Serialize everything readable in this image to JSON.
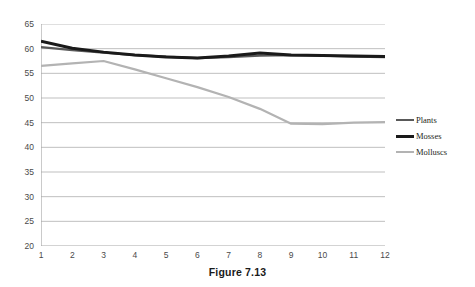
{
  "caption": "Figure 7.13",
  "legend": {
    "position": "right",
    "items": [
      {
        "label": "Plants",
        "color": "#595959",
        "width": 2.2,
        "name": "legend-item-plants"
      },
      {
        "label": "Mosses",
        "color": "#1a1a1a",
        "width": 3.0,
        "name": "legend-item-mosses"
      },
      {
        "label": "Molluscs",
        "color": "#b3b3b3",
        "width": 2.2,
        "name": "legend-item-molluscs"
      }
    ]
  },
  "chart_data": {
    "type": "line",
    "title": "",
    "xlabel": "",
    "ylabel": "",
    "grid": true,
    "x": [
      1,
      2,
      3,
      4,
      5,
      6,
      7,
      8,
      9,
      10,
      11,
      12
    ],
    "categories": [
      "1",
      "2",
      "3",
      "4",
      "5",
      "6",
      "7",
      "8",
      "9",
      "10",
      "11",
      "12"
    ],
    "xlim": [
      1,
      12
    ],
    "ylim": [
      20,
      65
    ],
    "yticks": [
      20,
      25,
      30,
      35,
      40,
      45,
      50,
      55,
      60,
      65
    ],
    "ytick_labels": [
      "20",
      "25",
      "30",
      "35",
      "40",
      "45",
      "50",
      "55",
      "60",
      "65"
    ],
    "series": [
      {
        "name": "Plants",
        "color": "#595959",
        "line_width": 2.2,
        "values": [
          60.3,
          59.7,
          59.2,
          58.7,
          58.4,
          58.1,
          58.3,
          58.6,
          58.7,
          58.6,
          58.4,
          58.3
        ]
      },
      {
        "name": "Mosses",
        "color": "#1a1a1a",
        "line_width": 3.0,
        "values": [
          61.5,
          60.1,
          59.3,
          58.7,
          58.3,
          58.1,
          58.5,
          59.1,
          58.7,
          58.6,
          58.5,
          58.4
        ]
      },
      {
        "name": "Molluscs",
        "color": "#b3b3b3",
        "line_width": 2.2,
        "values": [
          56.5,
          57.0,
          57.5,
          55.8,
          54.0,
          52.2,
          50.2,
          47.8,
          44.8,
          44.7,
          45.0,
          45.1
        ]
      }
    ]
  }
}
